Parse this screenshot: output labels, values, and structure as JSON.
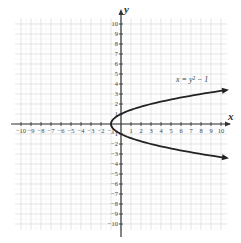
{
  "chart_data": {
    "type": "line",
    "title": "",
    "xlabel": "x",
    "ylabel": "y",
    "xlim": [
      -10,
      10
    ],
    "ylim": [
      -10,
      10
    ],
    "grid": true,
    "x_ticks": [
      -10,
      -9,
      -8,
      -7,
      -6,
      -5,
      -4,
      -3,
      -2,
      -1,
      1,
      2,
      3,
      4,
      5,
      6,
      7,
      8,
      9,
      10
    ],
    "y_ticks": [
      -10,
      -9,
      -8,
      -7,
      -6,
      -5,
      -4,
      -3,
      -2,
      -1,
      1,
      2,
      3,
      4,
      5,
      6,
      7,
      8,
      9,
      10
    ],
    "x_tick_labels": [
      "−10",
      "−9",
      "−8",
      "−7",
      "−6",
      "−5",
      "−4",
      "−3",
      "−2",
      "−1",
      "1",
      "2",
      "3",
      "4",
      "5",
      "6",
      "7",
      "8",
      "9",
      "10"
    ],
    "y_tick_labels": [
      "−10",
      "−9",
      "−8",
      "−7",
      "−6",
      "−5",
      "−4",
      "−3",
      "−2",
      "−1",
      "1",
      "2",
      "3",
      "4",
      "5",
      "6",
      "7",
      "8",
      "9",
      "10"
    ],
    "series": [
      {
        "name": "x = y² − 1",
        "equation": "x = y^2 - 1",
        "vertex": [
          -1,
          0
        ],
        "points": [
          [
            10,
            3.32
          ],
          [
            8,
            3
          ],
          [
            3,
            2
          ],
          [
            0,
            1
          ],
          [
            -0.75,
            0.5
          ],
          [
            -1,
            0
          ],
          [
            -0.75,
            -0.5
          ],
          [
            0,
            -1
          ],
          [
            3,
            -2
          ],
          [
            8,
            -3
          ],
          [
            10,
            -3.32
          ]
        ],
        "arrows": "both ends"
      }
    ],
    "annotations": [
      {
        "text": "x = y² − 1",
        "position": [
          5.5,
          4.2
        ]
      }
    ],
    "colors": {
      "curve": "#222222",
      "axis": "#333333",
      "grid": "#d8d8d8",
      "grid_minor": "#ececec"
    }
  },
  "labels": {
    "x_axis": "x",
    "y_axis": "y",
    "curve": "x = y² − 1"
  }
}
